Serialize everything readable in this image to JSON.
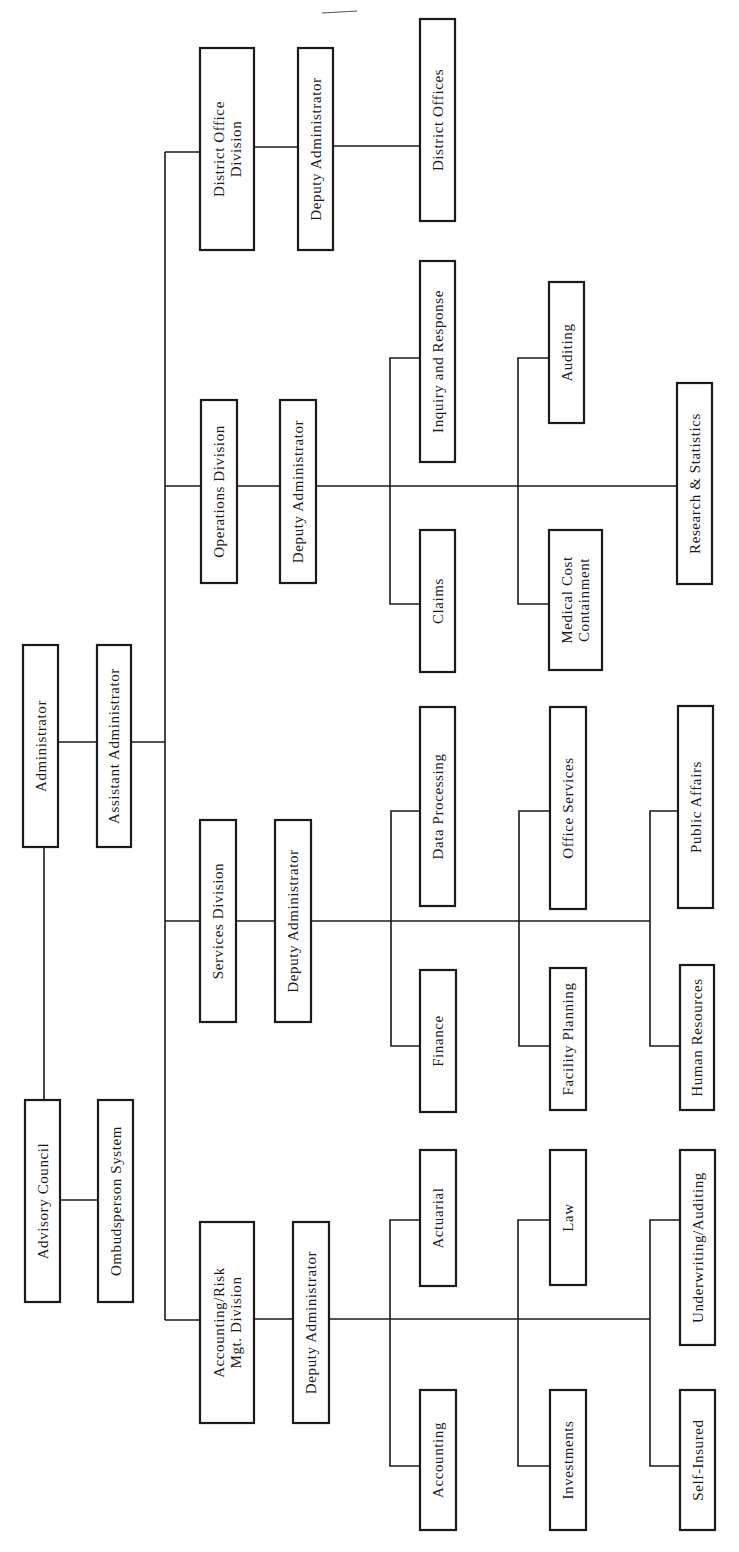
{
  "diagram": {
    "type": "org-chart",
    "orientation": "rotated-90-ccw",
    "colors": {
      "ink": "#1a1a1a",
      "background": "#ffffff"
    },
    "top": {
      "administrator": "Administrator",
      "assistant_administrator": "Assistant Administrator",
      "advisory_council": "Advisory Council",
      "ombudsperson_system": "Ombudsperson System"
    },
    "divisions": [
      {
        "name": "District Office Division",
        "name_lines": [
          "District Office",
          "Division"
        ],
        "deputy": "Deputy Administrator",
        "units": [
          "District Offices"
        ]
      },
      {
        "name": "Operations Division",
        "name_lines": [
          "Operations Division"
        ],
        "deputy": "Deputy Administrator",
        "units": [
          "Inquiry and Response",
          "Claims",
          "Auditing",
          "Medical Cost Containment",
          "Research & Statistics"
        ],
        "unit_lines": {
          "Medical Cost Containment": [
            "Medical Cost",
            "Containment"
          ]
        }
      },
      {
        "name": "Services Division",
        "name_lines": [
          "Services Division"
        ],
        "deputy": "Deputy Administrator",
        "units": [
          "Data Processing",
          "Finance",
          "Office Services",
          "Facility Planning",
          "Public Affairs",
          "Human Resources"
        ]
      },
      {
        "name": "Accounting/Risk Mgt. Division",
        "name_lines": [
          "Accounting/Risk",
          "Mgt. Division"
        ],
        "deputy": "Deputy Administrator",
        "units": [
          "Actuarial",
          "Accounting",
          "Law",
          "Investments",
          "Underwriting/Auditing",
          "Self-Insured"
        ]
      }
    ]
  }
}
